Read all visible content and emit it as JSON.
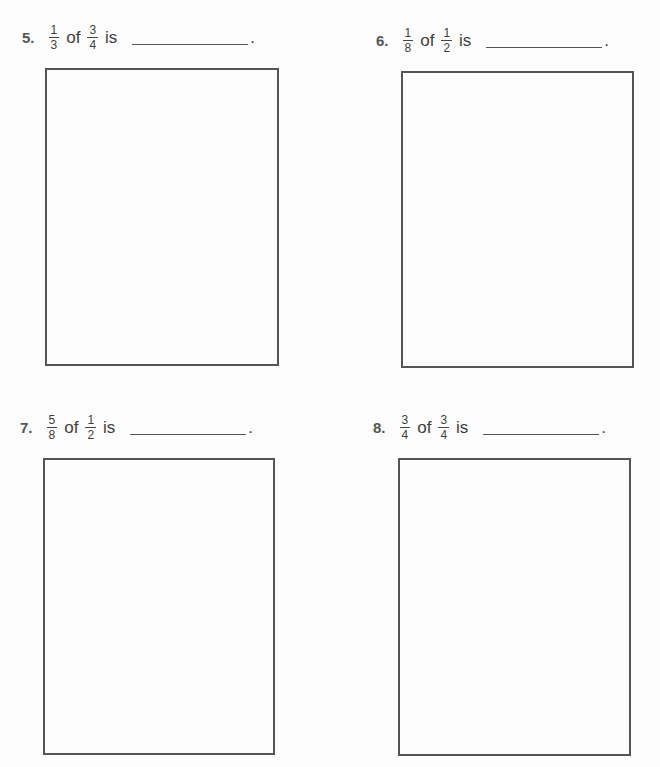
{
  "worksheet": {
    "problems": [
      {
        "number": "5.",
        "fraction_a": {
          "num": "1",
          "den": "3"
        },
        "word_of": "of",
        "fraction_b": {
          "num": "3",
          "den": "4"
        },
        "word_is": "is",
        "answer": "",
        "end": "."
      },
      {
        "number": "6.",
        "fraction_a": {
          "num": "1",
          "den": "8"
        },
        "word_of": "of",
        "fraction_b": {
          "num": "1",
          "den": "2"
        },
        "word_is": "is",
        "answer": "",
        "end": "."
      },
      {
        "number": "7.",
        "fraction_a": {
          "num": "5",
          "den": "8"
        },
        "word_of": "of",
        "fraction_b": {
          "num": "1",
          "den": "2"
        },
        "word_is": "is",
        "answer": "",
        "end": "."
      },
      {
        "number": "8.",
        "fraction_a": {
          "num": "3",
          "den": "4"
        },
        "word_of": "of",
        "fraction_b": {
          "num": "3",
          "den": "4"
        },
        "word_is": "is",
        "answer": "",
        "end": "."
      }
    ]
  }
}
